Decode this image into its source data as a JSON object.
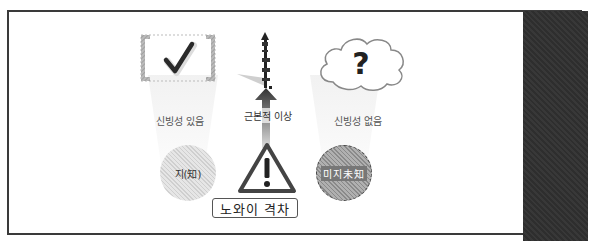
{
  "diagram": {
    "left_column": {
      "icon": "checkmark-in-brackets-icon",
      "label": "신빙성 있음",
      "circle_label": "지(知)"
    },
    "center_column": {
      "icon": "ruler-pole-icon",
      "label": "근본적 이상",
      "warning_icon": "warning-triangle-icon",
      "box_label": "노와이 격차"
    },
    "right_column": {
      "icon": "question-cloud-icon",
      "label": "신빙성 없음",
      "circle_label": "미지未知"
    },
    "colors": {
      "frame": "#3a3a3a",
      "dark_panel": "#333333",
      "known_circle": "#d9d9d9",
      "unknown_circle": "#9a9a9a",
      "text": "#555555"
    }
  }
}
